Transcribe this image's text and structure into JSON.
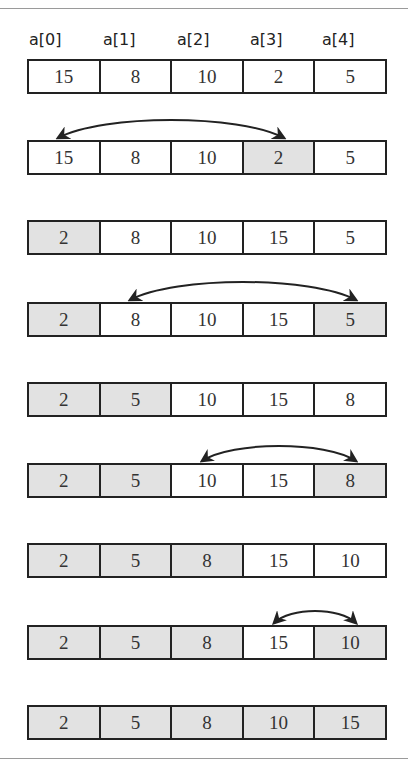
{
  "labels": [
    "a[0]",
    "a[1]",
    "a[2]",
    "a[3]",
    "a[4]"
  ],
  "rows": [
    {
      "top": 59,
      "values": [
        "15",
        "8",
        "10",
        "2",
        "5"
      ],
      "shaded": [
        false,
        false,
        false,
        false,
        false
      ]
    },
    {
      "top": 140,
      "values": [
        "15",
        "8",
        "10",
        "2",
        "5"
      ],
      "shaded": [
        false,
        false,
        false,
        true,
        false
      ]
    },
    {
      "top": 220,
      "values": [
        "2",
        "8",
        "10",
        "15",
        "5"
      ],
      "shaded": [
        true,
        false,
        false,
        false,
        false
      ]
    },
    {
      "top": 302,
      "values": [
        "2",
        "8",
        "10",
        "15",
        "5"
      ],
      "shaded": [
        true,
        false,
        false,
        false,
        true
      ]
    },
    {
      "top": 382,
      "values": [
        "2",
        "5",
        "10",
        "15",
        "8"
      ],
      "shaded": [
        true,
        true,
        false,
        false,
        false
      ]
    },
    {
      "top": 463,
      "values": [
        "2",
        "5",
        "10",
        "15",
        "8"
      ],
      "shaded": [
        true,
        true,
        false,
        false,
        true
      ]
    },
    {
      "top": 543,
      "values": [
        "2",
        "5",
        "8",
        "15",
        "10"
      ],
      "shaded": [
        true,
        true,
        true,
        false,
        false
      ]
    },
    {
      "top": 625,
      "values": [
        "2",
        "5",
        "8",
        "15",
        "10"
      ],
      "shaded": [
        true,
        true,
        true,
        false,
        true
      ]
    },
    {
      "top": 705,
      "values": [
        "2",
        "5",
        "8",
        "10",
        "15"
      ],
      "shaded": [
        true,
        true,
        true,
        true,
        true
      ]
    }
  ],
  "swaps": [
    {
      "row": 1,
      "from": 0,
      "to": 3
    },
    {
      "row": 3,
      "from": 1,
      "to": 4
    },
    {
      "row": 5,
      "from": 2,
      "to": 4
    },
    {
      "row": 7,
      "from": 3,
      "to": 4
    }
  ],
  "colors": {
    "shaded": "#e2e2e2",
    "border": "#222222",
    "text": "#333333"
  }
}
